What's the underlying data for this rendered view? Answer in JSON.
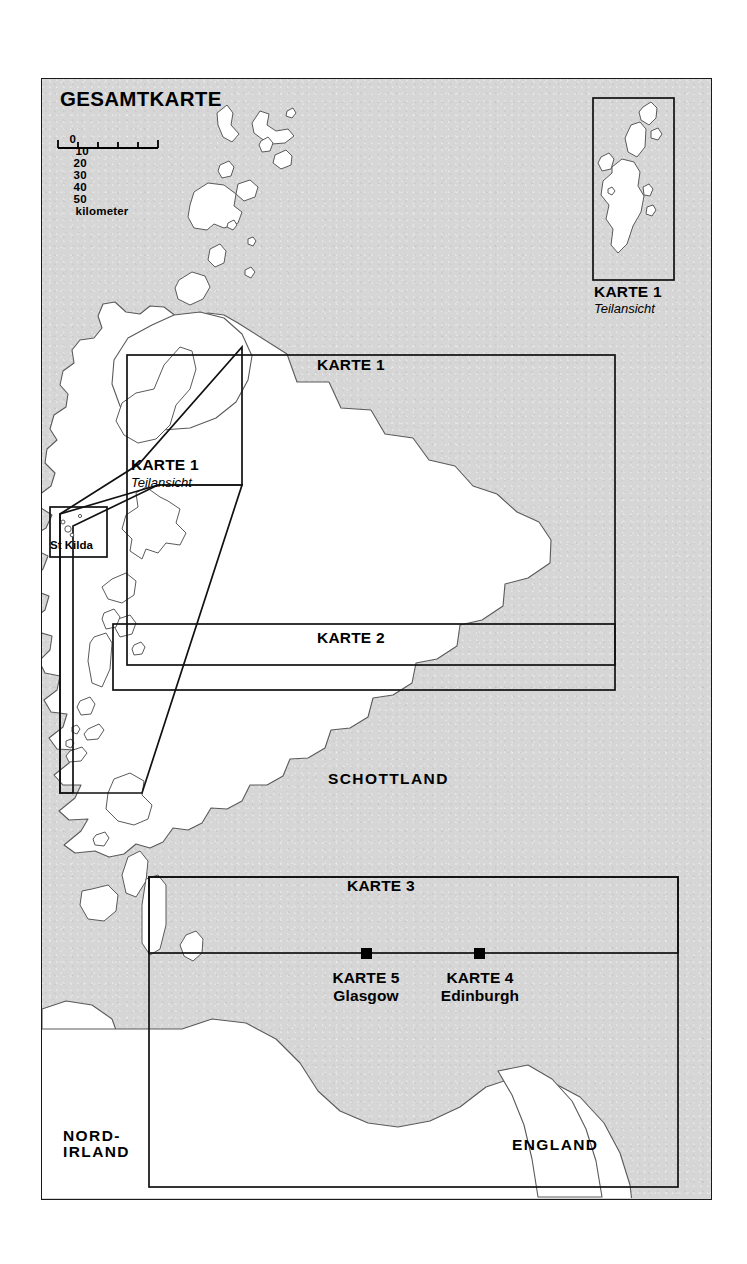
{
  "page": {
    "title": "GESAMTKARTE",
    "background": "#ffffff",
    "sea_color": "#d6d6d6",
    "land_color": "#ffffff",
    "line_color": "#111111"
  },
  "scale_bar": {
    "labels": [
      "0",
      "10",
      "20",
      "30",
      "40",
      "50"
    ],
    "unit": "kilometer",
    "max_km": 50,
    "step_km": 10
  },
  "inset_shetland": {
    "sheet_label": "KARTE 1",
    "sub_label": "Teilansicht"
  },
  "inset_hebrides": {
    "sheet_label": "KARTE 1",
    "sub_label": "Teilansicht"
  },
  "inset_stkilda": {
    "label": "St Kilda"
  },
  "sheets": [
    {
      "id": "karte-1",
      "label": "KARTE 1"
    },
    {
      "id": "karte-2",
      "label": "KARTE 2"
    },
    {
      "id": "karte-3",
      "label": "KARTE 3"
    }
  ],
  "cities": [
    {
      "id": "glasgow",
      "sheet": "KARTE 5",
      "name": "Glasgow"
    },
    {
      "id": "edinburgh",
      "sheet": "KARTE 4",
      "name": "Edinburgh"
    }
  ],
  "regions": [
    {
      "id": "schottland",
      "label": "SCHOTTLAND"
    },
    {
      "id": "england",
      "label": "ENGLAND"
    },
    {
      "id": "nordirland",
      "label": "NORD-\nIRLAND"
    }
  ]
}
